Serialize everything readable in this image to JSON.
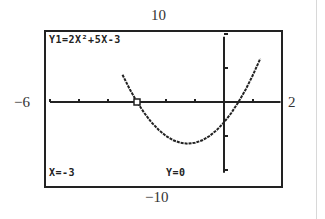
{
  "window": {
    "ymax_label": "10",
    "ymin_label": "−10",
    "xmin_label": "−6",
    "xmax_label": "2"
  },
  "screen": {
    "equation": "Y1=2X²+5X-3",
    "trace_x": "X=-3",
    "trace_y": "Y=0"
  },
  "colors": {
    "ink": "#222222",
    "background": "#ffffff"
  },
  "chart_data": {
    "type": "line",
    "title": "Y1=2X²+5X-3",
    "function": "2x^2+5x-3",
    "xlim": [
      -6,
      2
    ],
    "ylim": [
      -10,
      10
    ],
    "xscl": 1,
    "yscl": 5,
    "grid": false,
    "trace_point": {
      "x": -3,
      "y": 0
    },
    "series": [
      {
        "name": "Y1",
        "x": [
          -3.5,
          -3.25,
          -3.0,
          -2.75,
          -2.5,
          -2.25,
          -2.0,
          -1.75,
          -1.5,
          -1.25,
          -1.0,
          -0.75,
          -0.5,
          -0.25,
          0.0,
          0.25,
          0.5,
          0.75,
          1.0,
          1.25
        ],
        "values": [
          4.0,
          1.875,
          0.0,
          -1.625,
          -3.0,
          -4.125,
          -5.0,
          -5.625,
          -6.0,
          -6.125,
          -6.0,
          -5.625,
          -5.0,
          -4.125,
          -3.0,
          -1.625,
          0.0,
          1.875,
          4.0,
          6.375
        ]
      }
    ],
    "annotations": [
      "X=-3",
      "Y=0"
    ]
  }
}
